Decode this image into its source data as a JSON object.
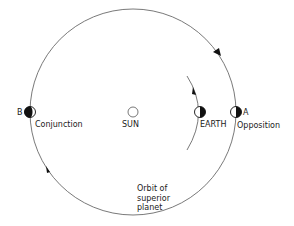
{
  "labels": {
    "point_b": "B",
    "conjunction": "Conjunction",
    "sun": "SUN",
    "earth": "EARTH",
    "point_a": "A",
    "opposition": "Opposition",
    "orbit_line1": "Orbit of",
    "orbit_line2": "superior",
    "orbit_line3": "planet"
  },
  "colors": {
    "line": "#6a6a6a",
    "fill": "#111111",
    "background": "#ffffff"
  }
}
